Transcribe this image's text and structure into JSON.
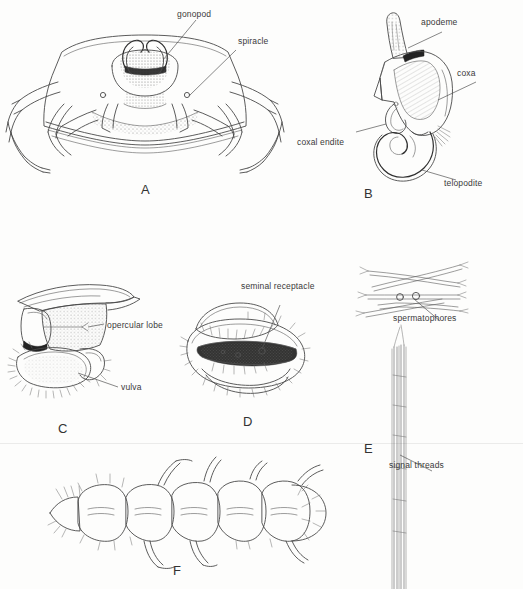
{
  "figure": {
    "type": "scientific-line-drawing-plate",
    "background_color": "#fdfdfc",
    "ink_color": "#4a4a4a",
    "panel_count": 6
  },
  "panels": [
    {
      "id": "A",
      "letter": "A",
      "subject": "ventral view of body with gonopods and spiracles",
      "labels": [
        {
          "key": "gonopod",
          "text": "gonopod"
        },
        {
          "key": "spiracle",
          "text": "spiracle"
        }
      ]
    },
    {
      "id": "B",
      "letter": "B",
      "subject": "gonopod detail",
      "labels": [
        {
          "key": "apodeme",
          "text": "apodeme"
        },
        {
          "key": "coxa",
          "text": "coxa"
        },
        {
          "key": "coxal_endite",
          "text": "coxal endite"
        },
        {
          "key": "telopodite",
          "text": "telopodite"
        }
      ]
    },
    {
      "id": "C",
      "letter": "C",
      "subject": "lateral view of female genital region",
      "labels": [
        {
          "key": "opercular_lobe",
          "text": "opercular lobe"
        },
        {
          "key": "vulva",
          "text": "vulva"
        }
      ]
    },
    {
      "id": "D",
      "letter": "D",
      "subject": "vulva with seminal receptacle",
      "labels": [
        {
          "key": "seminal_receptacle",
          "text": "seminal receptacle"
        }
      ]
    },
    {
      "id": "E",
      "letter": "E",
      "subject": "spermatophores on signal threads",
      "labels": [
        {
          "key": "spermatophores",
          "text": "spermatophores"
        },
        {
          "key": "signal_threads",
          "text": "signal threads"
        }
      ]
    },
    {
      "id": "F",
      "letter": "F",
      "subject": "dorsal view of segmented juvenile body",
      "labels": []
    }
  ]
}
